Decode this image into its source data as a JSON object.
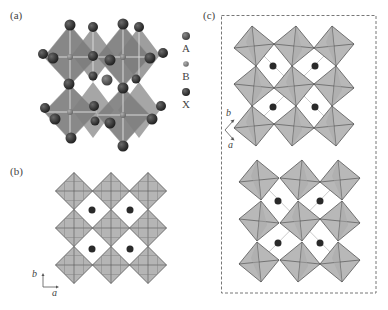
{
  "figure": {
    "panels": [
      {
        "id": "a",
        "label": "(a)",
        "description": "3D perovskite structure with corner-sharing BX6 octahedra and A-site cation"
      },
      {
        "id": "b",
        "label": "(b)",
        "description": "Undistorted octahedral network projected along c"
      },
      {
        "id": "c",
        "label": "(c)",
        "description": "Tilted octahedral networks (two layers) inside dashed box"
      }
    ],
    "legend": {
      "items": [
        {
          "symbol": "A",
          "label": "A",
          "color": "#5a5a5a",
          "size": "large"
        },
        {
          "symbol": "B",
          "label": "B",
          "color": "#8a8a8a",
          "size": "small"
        },
        {
          "symbol": "X",
          "label": "X",
          "color": "#3a3a3a",
          "size": "large"
        }
      ]
    },
    "axes_b": {
      "vertical": "b",
      "horizontal": "a"
    },
    "axes_c": {
      "up": "b",
      "down": "a"
    },
    "colors": {
      "octahedron_fill": "#b3b3b3",
      "octahedron_edge": "#555555",
      "atom_dark": "#333333",
      "dashed_box": "#777777"
    }
  }
}
